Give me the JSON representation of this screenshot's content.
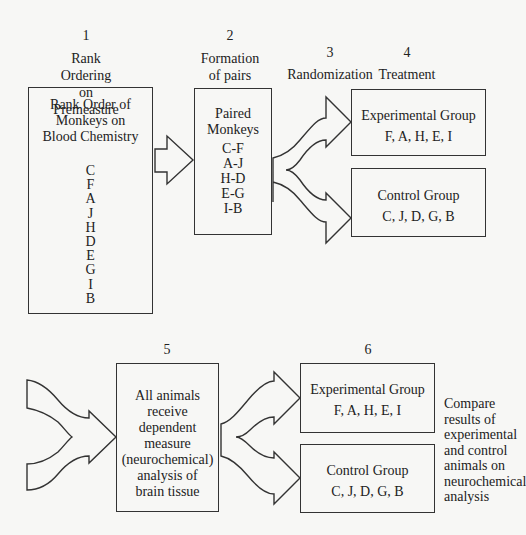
{
  "steps": [
    {
      "number": "1",
      "title_lines": [
        "Rank Ordering",
        "on Premeasure"
      ]
    },
    {
      "number": "2",
      "title_lines": [
        "Formation",
        "of pairs"
      ]
    },
    {
      "number": "3",
      "title_lines": [
        "Randomization"
      ]
    },
    {
      "number": "4",
      "title_lines": [
        "Treatment"
      ]
    },
    {
      "number": "5",
      "title_lines": []
    },
    {
      "number": "6",
      "title_lines": []
    }
  ],
  "rank_box": {
    "title_lines": [
      "Rank Order of",
      "Monkeys on",
      "Blood Chemistry"
    ],
    "order": [
      "C",
      "F",
      "A",
      "J",
      "H",
      "D",
      "E",
      "G",
      "I",
      "B"
    ]
  },
  "pairs_box": {
    "title_lines": [
      "Paired",
      "Monkeys"
    ],
    "pairs": [
      "C-F",
      "A-J",
      "H-D",
      "E-G",
      "I-B"
    ]
  },
  "treatment": {
    "experimental": {
      "title": "Experimental Group",
      "members": "F, A, H, E, I"
    },
    "control": {
      "title": "Control Group",
      "members": "C, J, D, G, B"
    }
  },
  "measure_box": {
    "lines": [
      "All animals",
      "receive",
      "dependent",
      "measure",
      "(neurochemical)",
      "analysis of",
      "brain tissue"
    ]
  },
  "results": {
    "experimental": {
      "title": "Experimental Group",
      "members": "F, A, H, E, I"
    },
    "control": {
      "title": "Control Group",
      "members": "C, J, D, G, B"
    }
  },
  "compare_text_lines": [
    "Compare",
    "results of",
    "experimental",
    "and control",
    "animals on",
    "neurochemical",
    "analysis"
  ]
}
